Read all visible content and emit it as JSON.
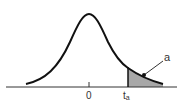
{
  "diagram": {
    "type": "t-distribution curve with shaded right tail",
    "labels": {
      "center": "0",
      "critical_main": "t",
      "critical_sub": "a",
      "area": "a"
    },
    "colors": {
      "curve": "#111111",
      "axis": "#333333",
      "shade": "#a8a8a8",
      "background": "#ffffff"
    }
  }
}
